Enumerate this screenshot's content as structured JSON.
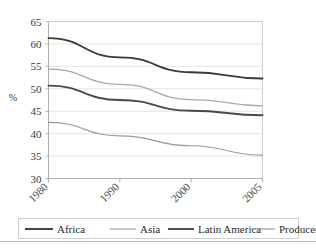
{
  "chart_data": {
    "type": "line",
    "title": "",
    "subtitle": "",
    "xlabel": "",
    "ylabel": "%",
    "categories": [
      "1980",
      "1990",
      "2000",
      "2005"
    ],
    "x": [
      1980,
      1990,
      2000,
      2005
    ],
    "ylim": [
      30,
      65
    ],
    "yticks": [
      30,
      35,
      40,
      45,
      50,
      55,
      60,
      65
    ],
    "ytick_labels": [
      "30",
      "35",
      "40",
      "45",
      "50",
      "55",
      "60",
      "65"
    ],
    "grid": true,
    "grid_axis": "y",
    "legend_position": "bottom",
    "xtick_rotation": 45,
    "series": [
      {
        "name": "Africa",
        "color": "#3b3b3b",
        "values": [
          61.3,
          57.0,
          53.7,
          52.3
        ]
      },
      {
        "name": "Asia",
        "color": "#a9a9a9",
        "values": [
          54.4,
          51.0,
          47.6,
          46.2
        ]
      },
      {
        "name": "Latin America",
        "color": "#4a4a4a",
        "values": [
          50.7,
          47.5,
          45.1,
          44.1
        ]
      },
      {
        "name": "Producers",
        "color": "#9c9c9c",
        "values": [
          42.5,
          39.5,
          37.3,
          35.2
        ]
      }
    ]
  },
  "axis": {
    "y_title": "%",
    "y_ticks": [
      "65",
      "60",
      "55",
      "50",
      "45",
      "40",
      "35",
      "30"
    ],
    "x_ticks": [
      "1980",
      "1990",
      "2000",
      "2005"
    ]
  },
  "legend": {
    "items": [
      {
        "label": "Africa",
        "color": "#3b3b3b",
        "width": 1.9
      },
      {
        "label": "Asia",
        "color": "#a9a9a9",
        "width": 1.3
      },
      {
        "label": "Latin America",
        "color": "#4a4a4a",
        "width": 1.9
      },
      {
        "label": "Producers",
        "color": "#9c9c9c",
        "width": 1.2
      }
    ]
  },
  "colors": {
    "frame": "#cfcfcf",
    "grid": "#e4e4e4",
    "axis": "#b4b4b4",
    "text": "#3a3a3a",
    "legend_border": "#d0d0d0",
    "page_rule": "#b9b9b9",
    "background": "#ffffff"
  }
}
